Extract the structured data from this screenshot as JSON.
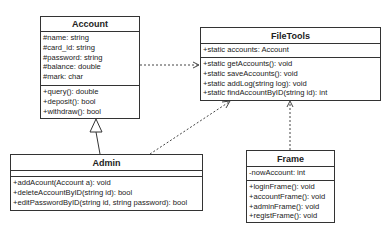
{
  "diagram": {
    "classes": {
      "account": {
        "name": "Account",
        "attributes": [
          "#name: string",
          "#card_id: string",
          "#password: string",
          "#balance: double",
          "#mark: char"
        ],
        "methods": [
          "+query(): double",
          "+deposit(): bool",
          "+withdraw(): bool"
        ]
      },
      "filetools": {
        "name": "FileTools",
        "attributes": [
          "+static accounts: Account"
        ],
        "methods": [
          "+static getAccounts(): void",
          "+static saveAccounts(): void",
          "+static addLog(string log): void",
          "+static findAccountByID(string id): int"
        ]
      },
      "admin": {
        "name": "Admin",
        "attributes": [],
        "methods": [
          "+addAcount(Account a): void",
          "+deleteAccountByID(string id): bool",
          "+editPasswordByID(string id, string password): bool"
        ]
      },
      "frame": {
        "name": "Frame",
        "attributes": [
          "-nowAccount: int"
        ],
        "methods": [
          "+loginFrame(): void",
          "+accountFrame(): void",
          "+adminFrame(): void",
          "+registFrame(): void"
        ]
      }
    },
    "relationships": [
      {
        "from": "Account",
        "to": "FileTools",
        "type": "dependency"
      },
      {
        "from": "Admin",
        "to": "Account",
        "type": "generalization"
      },
      {
        "from": "Admin",
        "to": "FileTools",
        "type": "dependency"
      },
      {
        "from": "Frame",
        "to": "FileTools",
        "type": "dependency"
      }
    ],
    "colors": {
      "line": "#333333",
      "background": "#ffffff"
    }
  }
}
